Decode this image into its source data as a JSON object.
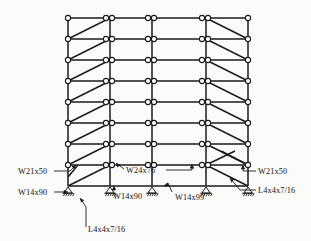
{
  "figure": {
    "kind": "structural-elevation",
    "background_color": "#fbfbf9",
    "line_color": "#1a1a1a",
    "joint_fill": "#ffffff"
  },
  "geometry": {
    "column_x": [
      68,
      110,
      152,
      206,
      248
    ],
    "level_y": [
      18,
      39,
      60,
      81,
      102,
      123,
      144,
      165,
      186
    ],
    "base_y": 186,
    "roof_y": 18,
    "stories": 8,
    "bays": 4,
    "support_type": "pinned",
    "support_count": 5
  },
  "labels": {
    "beam_left": "W21x50",
    "column_left": "W14x90",
    "beam_center": "W24x76",
    "column_center_2": "W14x90",
    "column_center_3": "W14x99",
    "brace_bottom": "L4x4x7/16",
    "beam_right": "W21x50",
    "brace_right": "L4x4x7/16"
  },
  "members": {
    "girder_sections": [
      "W21x50",
      "W24x76"
    ],
    "column_sections": [
      "W14x90",
      "W14x99"
    ],
    "brace_sections": [
      "L4x4x7/16"
    ]
  }
}
